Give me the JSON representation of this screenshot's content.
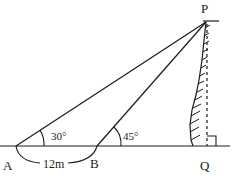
{
  "diagram": {
    "type": "angle-of-elevation",
    "points": {
      "A": {
        "label": "A"
      },
      "B": {
        "label": "B"
      },
      "P": {
        "label": "P"
      },
      "Q": {
        "label": "Q"
      }
    },
    "angles": {
      "at_A": "30°",
      "at_B": "45°"
    },
    "distance_AB": "12m",
    "right_angle_at": "Q",
    "colors": {
      "line": "#1a1a1a",
      "background": "#ffffff"
    }
  }
}
